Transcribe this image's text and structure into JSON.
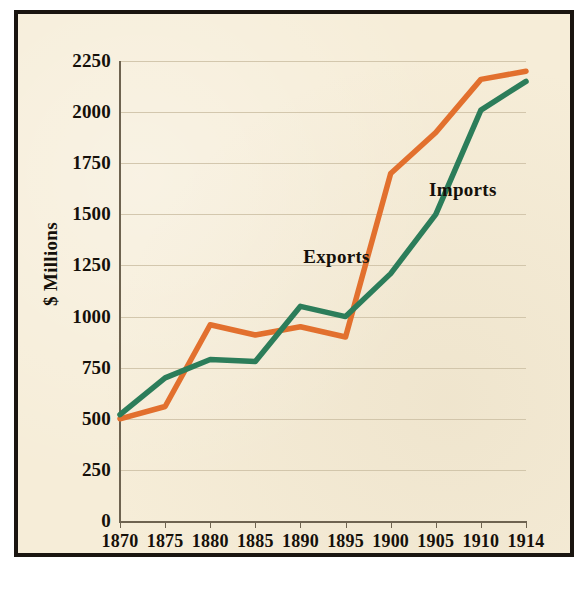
{
  "figure": {
    "background_color": "#f6edd8",
    "border_color": "#1a1510",
    "inner_rule_color": "#d9a48e"
  },
  "chart_data": {
    "type": "line",
    "title": "",
    "subtitle": "",
    "xlabel": "",
    "ylabel": "$ Millions",
    "x": [
      1870,
      1875,
      1880,
      1885,
      1890,
      1895,
      1900,
      1905,
      1910,
      1914
    ],
    "xticklabels": [
      "1870",
      "1875",
      "1880",
      "1885",
      "1890",
      "1895",
      "1900",
      "1905",
      "1910",
      "1914"
    ],
    "yticks": [
      0,
      250,
      500,
      750,
      1000,
      1250,
      1500,
      1750,
      2000,
      2250
    ],
    "yticklabels": [
      "0",
      "250",
      "500",
      "750",
      "1000",
      "1250",
      "1500",
      "1750",
      "2000",
      "2250"
    ],
    "ylim": [
      0,
      2250
    ],
    "grid": true,
    "grid_axis": "y",
    "grid_color": "#cdbfa4",
    "legend": "inline-annotations",
    "series": [
      {
        "name": "Exports",
        "color": "#e2702e",
        "values": [
          500,
          560,
          960,
          910,
          950,
          900,
          1700,
          1900,
          2160,
          2200
        ],
        "label_x": 1894,
        "label_y": 1290
      },
      {
        "name": "Imports",
        "color": "#2c7d5a",
        "values": [
          520,
          700,
          790,
          780,
          1050,
          1000,
          1210,
          1500,
          2010,
          2150
        ],
        "label_x": 1908,
        "label_y": 1620
      }
    ],
    "annotations": [
      {
        "text": "Exports",
        "series": "Exports"
      },
      {
        "text": "Imports",
        "series": "Imports"
      }
    ]
  }
}
